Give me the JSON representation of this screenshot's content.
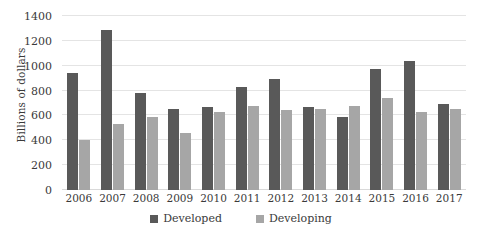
{
  "chart_data": {
    "type": "bar",
    "title": "",
    "subtitle": "",
    "xlabel": "",
    "ylabel": "Billions of dollars",
    "ylim": [
      0,
      1400
    ],
    "ytick_step": 200,
    "yticks": [
      1400,
      1200,
      1000,
      800,
      600,
      400,
      200,
      0
    ],
    "ytick_labels": [
      "1400",
      "1200",
      "1000",
      "800",
      "600",
      "400",
      "200",
      "0"
    ],
    "grid": true,
    "legend_position": "bottom",
    "categories": [
      "2006",
      "2007",
      "2008",
      "2009",
      "2010",
      "2011",
      "2012",
      "2013",
      "2014",
      "2015",
      "2016",
      "2017"
    ],
    "series": [
      {
        "name": "Developed",
        "color": "#595959",
        "values": [
          940,
          1285,
          780,
          650,
          670,
          830,
          890,
          670,
          590,
          975,
          1040,
          695
        ]
      },
      {
        "name": "Developing",
        "color": "#a6a6a6",
        "values": [
          400,
          535,
          590,
          455,
          630,
          680,
          645,
          655,
          675,
          740,
          625,
          655
        ]
      }
    ],
    "annotations": []
  },
  "legend": {
    "items": [
      {
        "label": "Developed",
        "color": "#595959"
      },
      {
        "label": "Developing",
        "color": "#a6a6a6"
      }
    ]
  },
  "colors": {
    "developed": "#595959",
    "developing": "#a6a6a6",
    "gridline": "#e4e4e4",
    "text": "#3a3a3a",
    "background": "#ffffff"
  }
}
